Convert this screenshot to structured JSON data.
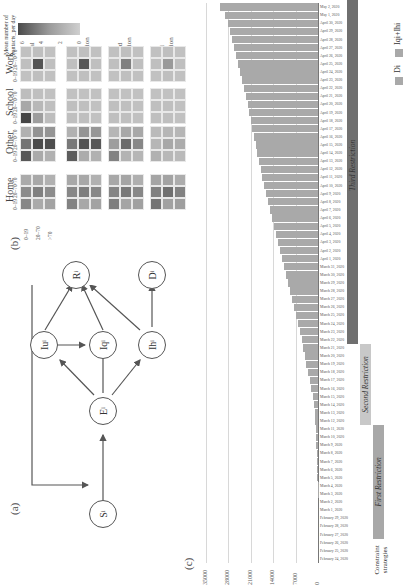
{
  "panels": {
    "a": {
      "label": "(a)"
    },
    "b": {
      "label": "(b)"
    },
    "c": {
      "label": "(c)"
    }
  },
  "diagram": {
    "nodes": [
      {
        "id": "S",
        "label": "S",
        "sub": "i"
      },
      {
        "id": "E",
        "label": "E",
        "sub": "i"
      },
      {
        "id": "Iu",
        "label": "Iu",
        "sub": "i"
      },
      {
        "id": "Iq",
        "label": "Iq",
        "sub": "i"
      },
      {
        "id": "Ih",
        "label": "Ih",
        "sub": "i"
      },
      {
        "id": "R",
        "label": "R",
        "sub": "i"
      },
      {
        "id": "D",
        "label": "D",
        "sub": "i"
      }
    ],
    "edges": [
      [
        "S",
        "E"
      ],
      [
        "E",
        "Iu"
      ],
      [
        "E",
        "Iq"
      ],
      [
        "E",
        "Ih"
      ],
      [
        "Iu",
        "Iq"
      ],
      [
        "Iu",
        "R"
      ],
      [
        "Iq",
        "R"
      ],
      [
        "Ih",
        "R"
      ],
      [
        "Ih",
        "D"
      ],
      [
        "R",
        "S"
      ]
    ]
  },
  "heatmap": {
    "colorbar": {
      "title_line1": "Mean number of",
      "title_line2": "contacts_per day",
      "ticks": [
        "0",
        "2",
        "4",
        "6"
      ]
    },
    "columns": [
      {
        "line1": "Normal",
        "line2": ""
      },
      {
        "line1": "First",
        "line2": "Restriction"
      },
      {
        "line1": "Second",
        "line2": "Restriction"
      },
      {
        "line1": "Third",
        "line2": "Restriction"
      }
    ],
    "rows": [
      "Work",
      "School",
      "Other",
      "Home"
    ],
    "age_groups": [
      "0–19",
      "20–70",
      ">70"
    ],
    "values": {
      "Work": [
        [
          [
            0.5,
            0.6,
            0.5
          ],
          [
            0.6,
            5.2,
            0.6
          ],
          [
            0.5,
            0.6,
            0.5
          ]
        ],
        [
          [
            0.5,
            0.6,
            0.5
          ],
          [
            0.6,
            5.0,
            0.6
          ],
          [
            0.5,
            0.6,
            0.5
          ]
        ],
        [
          [
            0.5,
            0.6,
            0.5
          ],
          [
            0.6,
            3.3,
            0.6
          ],
          [
            0.5,
            0.6,
            0.5
          ]
        ],
        [
          [
            0.5,
            0.6,
            0.5
          ],
          [
            0.6,
            2.2,
            0.6
          ],
          [
            0.5,
            0.6,
            0.5
          ]
        ]
      ],
      "School": [
        [
          [
            5.8,
            2.0,
            0.7
          ],
          [
            1.6,
            0.9,
            0.6
          ],
          [
            0.7,
            0.6,
            0.5
          ]
        ],
        [
          [
            0.6,
            0.6,
            0.5
          ],
          [
            0.6,
            0.6,
            0.5
          ],
          [
            0.5,
            0.5,
            0.5
          ]
        ],
        [
          [
            0.6,
            0.6,
            0.5
          ],
          [
            0.6,
            0.6,
            0.5
          ],
          [
            0.5,
            0.5,
            0.5
          ]
        ],
        [
          [
            0.6,
            0.6,
            0.5
          ],
          [
            0.6,
            0.6,
            0.5
          ],
          [
            0.5,
            0.5,
            0.5
          ]
        ]
      ],
      "Other": [
        [
          [
            5.0,
            1.5,
            1.2
          ],
          [
            3.8,
            5.6,
            5.5
          ],
          [
            1.2,
            2.5,
            2.4
          ]
        ],
        [
          [
            4.8,
            1.4,
            1.2
          ],
          [
            3.6,
            5.2,
            5.0
          ],
          [
            1.2,
            2.4,
            2.3
          ]
        ],
        [
          [
            3.2,
            1.1,
            1.0
          ],
          [
            2.0,
            4.2,
            3.0
          ],
          [
            1.0,
            1.6,
            1.6
          ]
        ],
        [
          [
            1.2,
            0.9,
            0.8
          ],
          [
            1.0,
            1.6,
            1.4
          ],
          [
            0.8,
            1.0,
            1.0
          ]
        ]
      ],
      "Home": [
        [
          [
            3.0,
            1.5,
            1.8
          ],
          [
            2.8,
            3.3,
            2.8
          ],
          [
            1.5,
            1.6,
            1.2
          ]
        ],
        [
          [
            3.2,
            1.6,
            1.8
          ],
          [
            3.0,
            3.4,
            3.0
          ],
          [
            1.6,
            1.6,
            1.2
          ]
        ],
        [
          [
            3.4,
            1.7,
            1.9
          ],
          [
            3.1,
            3.6,
            3.0
          ],
          [
            1.6,
            1.7,
            1.3
          ]
        ],
        [
          [
            3.8,
            1.9,
            2.0
          ],
          [
            3.3,
            4.0,
            3.2
          ],
          [
            1.7,
            1.8,
            1.4
          ]
        ]
      ]
    }
  },
  "chart_data": {
    "type": "bar",
    "title": "",
    "xlabel": "",
    "ylabel": "",
    "ylim": [
      0,
      35000
    ],
    "yticks": [
      "0",
      "7000",
      "14000",
      "21000",
      "28000",
      "35000"
    ],
    "grid": true,
    "legend_position": "bottom-right",
    "legend": [
      "Di",
      "Iqi+Ihi"
    ],
    "categories": [
      "February 24, 2020",
      "February 25, 2020",
      "February 26, 2020",
      "February 27, 2020",
      "February 28, 2020",
      "February 29, 2020",
      "March 1, 2020",
      "March 2, 2020",
      "March 3, 2020",
      "March 4, 2020",
      "March 5, 2020",
      "March 6, 2020",
      "March 7, 2020",
      "March 8, 2020",
      "March 9, 2020",
      "March 10, 2020",
      "March 11, 2020",
      "March 12, 2020",
      "March 13, 2020",
      "March 14, 2020",
      "March 15, 2020",
      "March 16, 2020",
      "March 17, 2020",
      "March 18, 2020",
      "March 19, 2020",
      "March 20, 2020",
      "March 21, 2020",
      "March 22, 2020",
      "March 23, 2020",
      "March 24, 2020",
      "March 25, 2020",
      "March 26, 2020",
      "March 27, 2020",
      "March 28, 2020",
      "March 29, 2020",
      "March 30, 2020",
      "March 31, 2020",
      "April 1, 2020",
      "April 2, 2020",
      "April 3, 2020",
      "April 4, 2020",
      "April 5, 2020",
      "April 6, 2020",
      "April 7, 2020",
      "April 8, 2020",
      "April 9, 2020",
      "April 10, 2020",
      "April 11, 2020",
      "April 12, 2020",
      "April 13, 2020",
      "April 14, 2020",
      "April 15, 2020",
      "April 16, 2020",
      "April 17, 2020",
      "April 18, 2020",
      "April 19, 2020",
      "April 20, 2020",
      "April 21, 2020",
      "April 22, 2020",
      "April 23, 2020",
      "April 24, 2020",
      "April 25, 2020",
      "April 26, 2020",
      "April 27, 2020",
      "April 28, 2020",
      "April 29, 2020",
      "April 30, 2020",
      "May 1, 2020",
      "May 2, 2020"
    ],
    "series": [
      {
        "name": "Di+Iqi+Ihi",
        "values": [
          0,
          0,
          0,
          0,
          0,
          0,
          0,
          0,
          100,
          150,
          200,
          250,
          300,
          400,
          500,
          600,
          700,
          800,
          1000,
          1300,
          1700,
          2100,
          2600,
          3100,
          3600,
          4100,
          4600,
          5100,
          5600,
          6200,
          6800,
          7400,
          8000,
          8600,
          9300,
          10000,
          10700,
          11300,
          12000,
          12600,
          13200,
          13800,
          14400,
          15000,
          15600,
          16200,
          16800,
          17400,
          17900,
          18500,
          19000,
          19500,
          20000,
          20500,
          21000,
          21500,
          22000,
          22600,
          23200,
          23800,
          24400,
          25000,
          25600,
          26200,
          26800,
          27500,
          28200,
          29000,
          30500
        ]
      }
    ]
  },
  "strategies": {
    "axis_label_line1": "Constraint",
    "axis_label_line2": "strategies",
    "items": [
      {
        "label": "First Restriction",
        "start": 0,
        "end": 14,
        "color": "#a8a8a8"
      },
      {
        "label": "Second Restriction",
        "start": 14,
        "end": 24,
        "color": "#c8c8c8"
      },
      {
        "label": "Third Restriction",
        "start": 24,
        "end": 68,
        "color": "#6f6f6f"
      }
    ]
  }
}
